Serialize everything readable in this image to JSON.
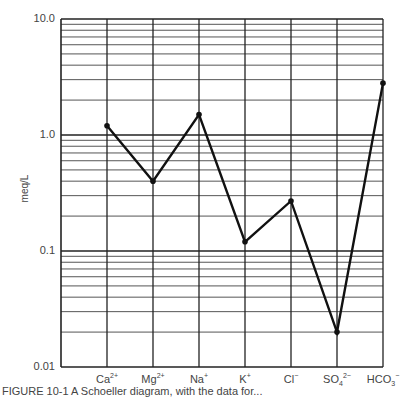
{
  "chart_data": {
    "type": "line",
    "title": "",
    "xlabel": "",
    "ylabel": "meq/L",
    "yscale": "log",
    "ylim": [
      0.01,
      10.0
    ],
    "grid": true,
    "y_tick_labels": [
      "10.0",
      "1.0",
      "0.1",
      "0.01"
    ],
    "categories": [
      "Ca2+",
      "Mg2+",
      "Na+",
      "K+",
      "Cl-",
      "SO42-",
      "HCO3-"
    ],
    "category_labels": [
      {
        "base": "Ca",
        "sup": "2+",
        "sub": ""
      },
      {
        "base": "Mg",
        "sup": "2+",
        "sub": ""
      },
      {
        "base": "Na",
        "sup": "+",
        "sub": ""
      },
      {
        "base": "K",
        "sup": "+",
        "sub": ""
      },
      {
        "base": "Cl",
        "sup": "−",
        "sub": ""
      },
      {
        "base": "SO",
        "sup": "2−",
        "sub": "4"
      },
      {
        "base": "HCO",
        "sup": "−",
        "sub": "3"
      }
    ],
    "values": [
      1.2,
      0.4,
      1.5,
      0.12,
      0.27,
      0.02,
      2.8
    ],
    "line_color": "#111111"
  },
  "caption": "FIGURE 10-1 A Schoeller diagram, with the data for..."
}
